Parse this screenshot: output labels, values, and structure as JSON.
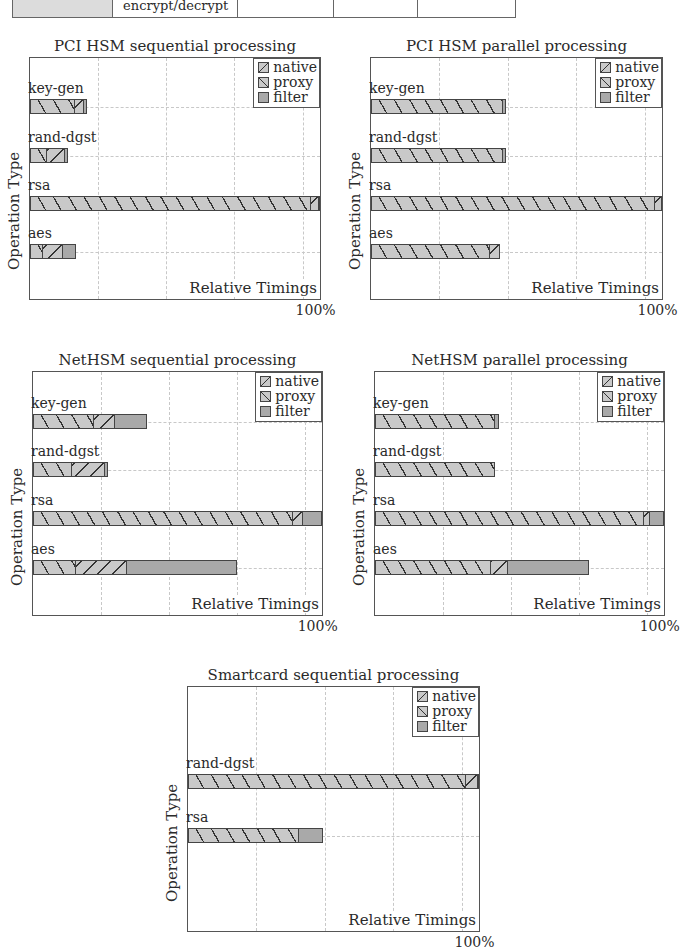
{
  "table_fragment": {
    "cells": [
      "",
      "encrypt/decrypt",
      "",
      "",
      ""
    ],
    "widths": [
      120,
      150,
      115,
      100,
      117
    ]
  },
  "legend": [
    {
      "key": "native",
      "label": "native"
    },
    {
      "key": "proxy",
      "label": "proxy"
    },
    {
      "key": "filter",
      "label": "filter"
    }
  ],
  "chart_data": [
    {
      "type": "bar",
      "orientation": "horizontal",
      "stacked": true,
      "title": "PCI HSM sequential processing",
      "xlabel": "Relative Timings",
      "ylabel": "Operation Type",
      "x_tick_label": "100%",
      "categories": [
        "key-gen",
        "rand-dgst",
        "rsa",
        "aes"
      ],
      "series": [
        {
          "name": "native",
          "values": [
            15.5,
            6,
            97,
            4.5
          ]
        },
        {
          "name": "proxy",
          "values": [
            3,
            6,
            2.5,
            7
          ]
        },
        {
          "name": "filter",
          "values": [
            1,
            1,
            0.5,
            4.5
          ]
        }
      ],
      "xlim": [
        0,
        100
      ],
      "grid": true,
      "legend_position": "top-right",
      "frame": {
        "x": 29,
        "y": 57,
        "w": 292,
        "h": 243
      }
    },
    {
      "type": "bar",
      "orientation": "horizontal",
      "stacked": true,
      "title": "PCI HSM parallel processing",
      "xlabel": "Relative Timings",
      "ylabel": "Operation Type",
      "x_tick_label": "100%",
      "categories": [
        "key-gen",
        "rand-dgst",
        "rsa",
        "aes"
      ],
      "series": [
        {
          "name": "native",
          "values": [
            45.5,
            45.5,
            97.5,
            41
          ]
        },
        {
          "name": "proxy",
          "values": [
            0,
            0,
            2.5,
            3.5
          ]
        },
        {
          "name": "filter",
          "values": [
            1,
            1,
            0,
            0
          ]
        }
      ],
      "xlim": [
        0,
        100
      ],
      "grid": true,
      "legend_position": "top-right",
      "frame": {
        "x": 370,
        "y": 57,
        "w": 293,
        "h": 243
      }
    },
    {
      "type": "bar",
      "orientation": "horizontal",
      "stacked": true,
      "title": "NetHSM sequential processing",
      "xlabel": "Relative Timings",
      "ylabel": "Operation Type",
      "x_tick_label": "100%",
      "categories": [
        "key-gen",
        "rand-dgst",
        "rsa",
        "aes"
      ],
      "series": [
        {
          "name": "native",
          "values": [
            21,
            13.5,
            90,
            15
          ]
        },
        {
          "name": "proxy",
          "values": [
            7.5,
            11.5,
            3.5,
            17.5
          ]
        },
        {
          "name": "filter",
          "values": [
            11,
            1,
            6.5,
            38
          ]
        }
      ],
      "xlim": [
        0,
        100
      ],
      "grid": true,
      "legend_position": "top-right",
      "frame": {
        "x": 32,
        "y": 371,
        "w": 291,
        "h": 245
      }
    },
    {
      "type": "bar",
      "orientation": "horizontal",
      "stacked": true,
      "title": "NetHSM parallel processing",
      "xlabel": "Relative Timings",
      "ylabel": "Operation Type",
      "x_tick_label": "100%",
      "categories": [
        "key-gen",
        "rand-dgst",
        "rsa",
        "aes"
      ],
      "series": [
        {
          "name": "native",
          "values": [
            41.5,
            41.5,
            93,
            40
          ]
        },
        {
          "name": "proxy",
          "values": [
            0,
            0,
            2,
            6
          ]
        },
        {
          "name": "filter",
          "values": [
            1.5,
            0,
            5,
            28
          ]
        }
      ],
      "xlim": [
        0,
        100
      ],
      "grid": true,
      "legend_position": "top-right",
      "frame": {
        "x": 374,
        "y": 371,
        "w": 291,
        "h": 245
      }
    },
    {
      "type": "bar",
      "orientation": "horizontal",
      "stacked": true,
      "title": "Smartcard sequential processing",
      "xlabel": "Relative Timings",
      "ylabel": "Operation Type",
      "x_tick_label": "100%",
      "categories": [
        "rand-dgst",
        "rsa"
      ],
      "series": [
        {
          "name": "native",
          "values": [
            95.5,
            38
          ]
        },
        {
          "name": "proxy",
          "values": [
            4,
            0
          ]
        },
        {
          "name": "filter",
          "values": [
            0.5,
            8.5
          ]
        }
      ],
      "xlim": [
        0,
        100
      ],
      "grid": true,
      "legend_position": "top-right",
      "frame": {
        "x": 187,
        "y": 686,
        "w": 293,
        "h": 246
      }
    }
  ]
}
